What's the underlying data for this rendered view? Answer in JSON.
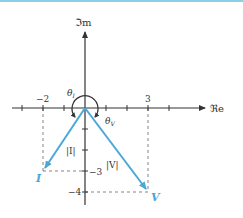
{
  "diagram": {
    "axes": {
      "x_label": "ℜe",
      "y_label": "ℑm",
      "x_tick_labels": [
        {
          "value": -2,
          "text": "−2"
        },
        {
          "value": 3,
          "text": "3"
        }
      ],
      "y_tick_labels": [
        {
          "value": -3,
          "text": "−3"
        },
        {
          "value": -4,
          "text": "−4"
        }
      ]
    },
    "vectors": [
      {
        "name": "I",
        "label": "I",
        "magnitude_label": "|I|",
        "x": -2,
        "y": -3,
        "angle_label": "θ",
        "angle_sub": "I"
      },
      {
        "name": "V",
        "label": "V",
        "magnitude_label": "|V|",
        "x": 3,
        "y": -4,
        "angle_label": "θ",
        "angle_sub": "V"
      }
    ],
    "colors": {
      "vector": "#4aa8d8",
      "axis": "#333333",
      "top_bar": "#8ecfe6"
    }
  }
}
